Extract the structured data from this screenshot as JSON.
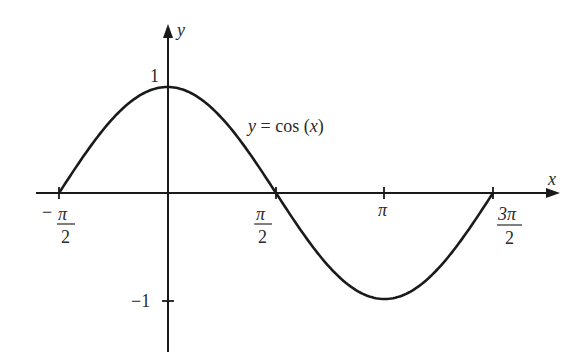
{
  "chart_data": {
    "type": "line",
    "title": "",
    "xlabel": "x",
    "ylabel": "y",
    "annotation": "y = cos (x)",
    "xlim": [
      -1.5708,
      4.7124
    ],
    "ylim": [
      -1.2,
      1.2
    ],
    "grid": false,
    "legend": "none",
    "x_ticks": [
      {
        "value": -1.5708,
        "label": "−π/2",
        "num": "π",
        "den": "2",
        "sign": "−"
      },
      {
        "value": 1.5708,
        "label": "π/2",
        "num": "π",
        "den": "2",
        "sign": ""
      },
      {
        "value": 3.1416,
        "label": "π"
      },
      {
        "value": 4.7124,
        "label": "3π/2",
        "num": "3π",
        "den": "2",
        "sign": ""
      }
    ],
    "y_ticks": [
      {
        "value": 1,
        "label": "1"
      },
      {
        "value": -1,
        "label": "−1"
      }
    ],
    "series": [
      {
        "name": "y = cos(x)",
        "x": [
          -1.5708,
          -0.7854,
          0,
          0.7854,
          1.5708,
          2.3562,
          3.1416,
          3.927,
          4.7124
        ],
        "y": [
          0,
          0.7071,
          1,
          0.7071,
          0,
          -0.7071,
          -1,
          -0.7071,
          0
        ]
      }
    ],
    "color": "#1a1a1a"
  },
  "labels": {
    "x_axis": "x",
    "y_axis": "y",
    "curve": "y = cos (x)",
    "y_one": "1",
    "y_neg_one": "−1",
    "tick_neg_half_pi_sign": "−",
    "tick_neg_half_pi_num": "π",
    "tick_neg_half_pi_den": "2",
    "tick_half_pi_num": "π",
    "tick_half_pi_den": "2",
    "tick_pi": "π",
    "tick_three_half_pi_num": "3π",
    "tick_three_half_pi_den": "2"
  }
}
